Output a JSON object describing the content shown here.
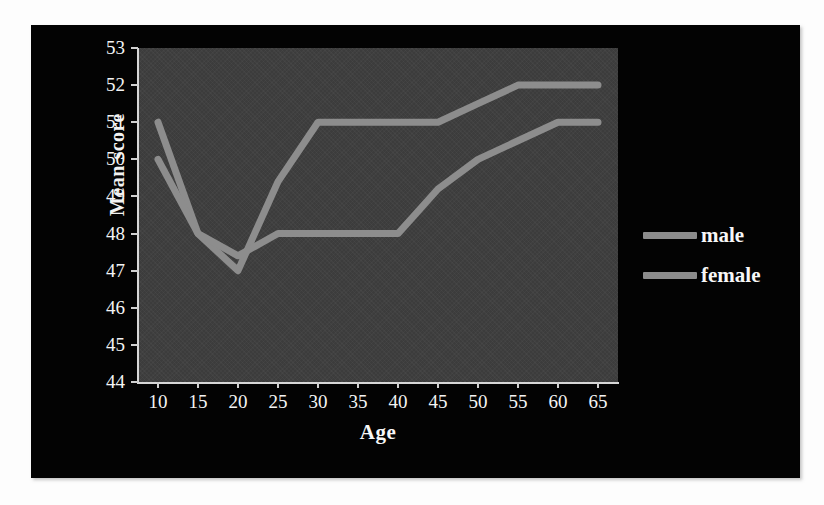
{
  "chart_data": {
    "type": "line",
    "title": "",
    "xlabel": "Age",
    "ylabel": "Mean score",
    "x": [
      10,
      15,
      20,
      25,
      30,
      35,
      40,
      45,
      50,
      55,
      60,
      65
    ],
    "xticklabels": [
      "10",
      "15",
      "20",
      "25",
      "30",
      "35",
      "40",
      "45",
      "50",
      "55",
      "60",
      "65"
    ],
    "yticklabels": [
      "44",
      "45",
      "46",
      "47",
      "48",
      "49",
      "50",
      "51",
      "52",
      "53"
    ],
    "xlim": [
      7.5,
      67.5
    ],
    "ylim": [
      44,
      53
    ],
    "grid": false,
    "legend_position": "right",
    "plot_bgcolor": "#3e3e3e",
    "figure_bgcolor": "#030303",
    "line_color": "#8d8d8d",
    "series": [
      {
        "name": "male",
        "color": "#8d8d8d",
        "values": [
          51,
          48,
          47,
          49.4,
          51,
          51,
          51,
          51,
          51.5,
          52,
          52,
          52
        ]
      },
      {
        "name": "female",
        "color": "#8d8d8d",
        "values": [
          50,
          48,
          47.4,
          48,
          48,
          48,
          48,
          49.2,
          50,
          50.5,
          51,
          51
        ]
      }
    ]
  },
  "legend": {
    "items": [
      {
        "label": "male"
      },
      {
        "label": "female"
      }
    ]
  }
}
